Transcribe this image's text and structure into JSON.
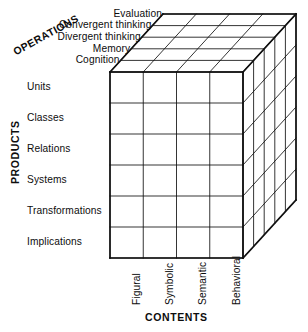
{
  "figure": {
    "name": "Structure of Intellect model",
    "background_color": "#ffffff",
    "line_color": "#101010"
  },
  "axes": {
    "operations": {
      "title": "OPERATIONS",
      "labels": [
        "Evaluation",
        "Convergent thinking",
        "Divergent thinking",
        "Memory",
        "Cognition"
      ]
    },
    "products": {
      "title": "PRODUCTS",
      "labels": [
        "Units",
        "Classes",
        "Relations",
        "Systems",
        "Transformations",
        "Implications"
      ]
    },
    "contents": {
      "title": "CONTENTS",
      "labels": [
        "Figural",
        "Symbolic",
        "Semantic",
        "Behavioral"
      ]
    }
  },
  "chart_data": {
    "type": "diagram",
    "subtype": "3d-grid-cube",
    "dimensions": {
      "contents": 4,
      "products": 6,
      "operations": 5
    },
    "categories": {
      "contents": [
        "Figural",
        "Symbolic",
        "Semantic",
        "Behavioral"
      ],
      "products": [
        "Units",
        "Classes",
        "Relations",
        "Systems",
        "Transformations",
        "Implications"
      ],
      "operations": [
        "Evaluation",
        "Convergent thinking",
        "Divergent thinking",
        "Memory",
        "Cognition"
      ]
    },
    "total_cells": 120,
    "geometry": {
      "front_left_x": 110,
      "front_right_x": 243,
      "front_top_y": 72,
      "front_bottom_y": 258,
      "depth_dx": 53,
      "depth_dy": -58
    }
  }
}
